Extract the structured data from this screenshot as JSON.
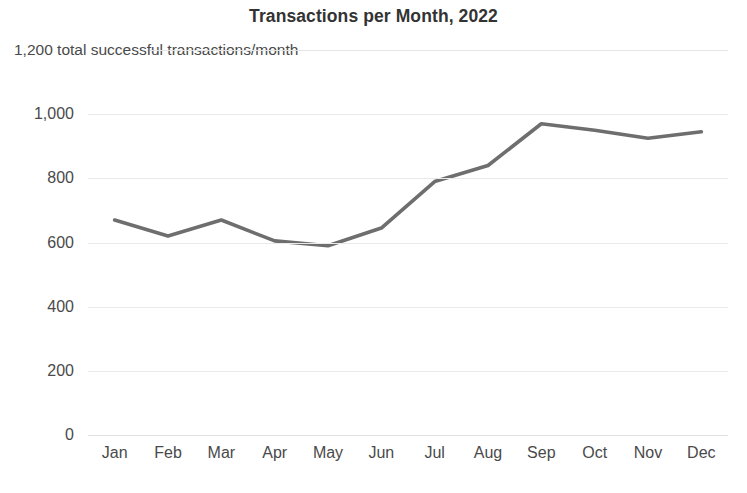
{
  "chart_data": {
    "type": "line",
    "title": "Transactions per Month, 2022",
    "subtitle": "1,200 total successful transactions/month",
    "xlabel": "",
    "ylabel": "",
    "categories": [
      "Jan",
      "Feb",
      "Mar",
      "Apr",
      "May",
      "Jun",
      "Jul",
      "Aug",
      "Sep",
      "Oct",
      "Nov",
      "Dec"
    ],
    "series": [
      {
        "name": "Successful transactions",
        "values": [
          670,
          620,
          670,
          605,
          590,
          645,
          790,
          840,
          970,
          950,
          925,
          945
        ],
        "color": "#6e6e6e"
      }
    ],
    "ylim": [
      0,
      1200
    ],
    "y_ticks": [
      0,
      200,
      400,
      600,
      800,
      1000
    ],
    "y_tick_labels": [
      "0",
      "200",
      "400",
      "600",
      "800",
      "1,000"
    ],
    "top_gridline_value": 1200,
    "grid": true,
    "grid_color": "#e9e9e9",
    "legend": "none",
    "background": "#ffffff"
  }
}
